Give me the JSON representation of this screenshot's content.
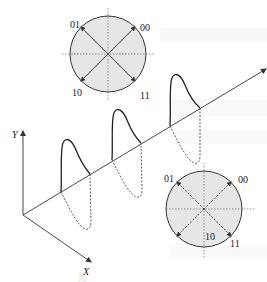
{
  "diagram": {
    "type": "QPSK constellation and phase-modulated carrier",
    "top_constellation": {
      "labels": {
        "upper_left": "01",
        "upper_right": "00",
        "lower_left": "10",
        "lower_right": "11"
      },
      "arrows": "solid",
      "fill": "#e8e8e8"
    },
    "bottom_constellation": {
      "labels": {
        "upper_left": "01",
        "upper_right": "00",
        "lower_left": "10",
        "lower_right": "11"
      },
      "arrows": "dashed",
      "fill": "#e8e8e8"
    },
    "axes": {
      "y_label": "Y",
      "x_label": "X"
    },
    "caption": "图",
    "colors": {
      "stroke": "#333333",
      "circle_fill": "#e6e6e6",
      "background": "#ffffff"
    }
  }
}
